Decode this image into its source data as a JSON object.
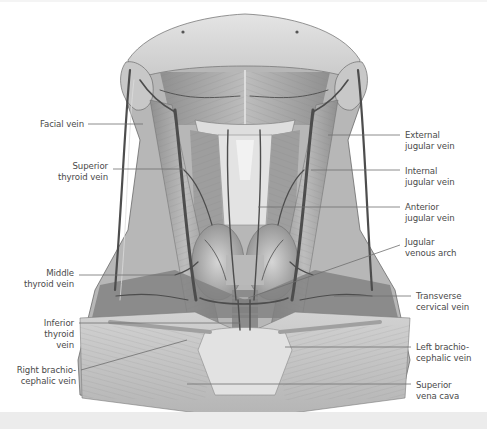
{
  "figure": {
    "labels_left": [
      {
        "id": "facial-vein",
        "text": "Facial vein",
        "x": 24,
        "y": 119,
        "w": 60,
        "lineFrom": [
          88,
          124
        ],
        "lineTo": [
          143,
          124
        ]
      },
      {
        "id": "superior-thyroid-vein",
        "text": "Superior\nthyroid vein",
        "x": 24,
        "y": 161,
        "w": 84,
        "lineFrom": [
          113,
          169
        ],
        "lineTo": [
          184,
          169
        ]
      },
      {
        "id": "middle-thyroid-vein",
        "text": "Middle\nthyroid vein",
        "x": 10,
        "y": 268,
        "w": 64,
        "lineFrom": [
          79,
          275
        ],
        "lineTo": [
          175,
          275
        ]
      },
      {
        "id": "inferior-thyroid-vein",
        "text": "Inferior\nthyroid\nvein",
        "x": 10,
        "y": 318,
        "w": 64,
        "lineFrom": [
          79,
          323
        ],
        "lineTo": [
          240,
          323
        ]
      },
      {
        "id": "right-brachiocephalic-vein",
        "text": "Right brachio-\ncephalic vein",
        "x": 4,
        "y": 365,
        "w": 72,
        "lineFrom": [
          81,
          370
        ],
        "lineTo": [
          187,
          340
        ]
      }
    ],
    "labels_right": [
      {
        "id": "external-jugular-vein",
        "text": "External\njugular vein",
        "x": 405,
        "y": 130,
        "lineFrom": [
          328,
          135
        ],
        "lineTo": [
          400,
          135
        ]
      },
      {
        "id": "internal-jugular-vein",
        "text": "Internal\njugular vein",
        "x": 405,
        "y": 166,
        "lineFrom": [
          311,
          170
        ],
        "lineTo": [
          400,
          170
        ]
      },
      {
        "id": "anterior-jugular-vein",
        "text": "Anterior\njugular vein",
        "x": 405,
        "y": 202,
        "lineFrom": [
          258,
          207
        ],
        "lineTo": [
          400,
          207
        ]
      },
      {
        "id": "jugular-venous-arch",
        "text": "Jugular\nvenous arch",
        "x": 405,
        "y": 237,
        "lineFrom": [
          248,
          298
        ],
        "lineTo": [
          400,
          245
        ]
      },
      {
        "id": "transverse-cervical-vein",
        "text": "Transverse\ncervical vein",
        "x": 416,
        "y": 291,
        "lineFrom": [
          334,
          296
        ],
        "lineTo": [
          411,
          296
        ]
      },
      {
        "id": "left-brachiocephalic-vein",
        "text": "Left brachio-\ncephalic vein",
        "x": 416,
        "y": 342,
        "lineFrom": [
          285,
          347
        ],
        "lineTo": [
          411,
          347
        ]
      },
      {
        "id": "superior-vena-cava",
        "text": "Superior\nvena cava",
        "x": 416,
        "y": 380,
        "lineFrom": [
          187,
          384
        ],
        "lineTo": [
          411,
          384
        ]
      }
    ]
  },
  "colors": {
    "background": "#ffffff",
    "label_text": "#4a4a4a",
    "leader_line": "#6e6e6e",
    "bottom_band": "#ececec"
  }
}
